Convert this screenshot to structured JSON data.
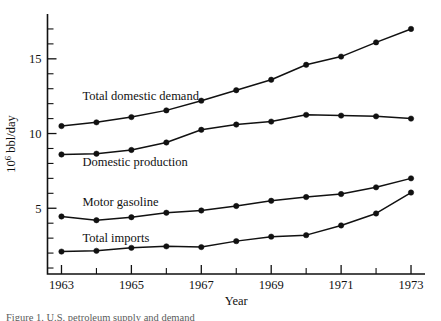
{
  "figure": {
    "caption_fragment": "Figure 1. U.S. petroleum supply and demand"
  },
  "chart_data": {
    "type": "line",
    "title": "",
    "xlabel": "Year",
    "ylabel": "10⁶ bbl/day",
    "x": [
      1963,
      1964,
      1965,
      1966,
      1967,
      1968,
      1969,
      1970,
      1971,
      1972,
      1973
    ],
    "xlim": [
      1962.6,
      1973.4
    ],
    "ylim": [
      0.6,
      18.0
    ],
    "xticks": [
      1963,
      1964,
      1965,
      1966,
      1967,
      1968,
      1969,
      1970,
      1971,
      1972,
      1973
    ],
    "xtick_labels": [
      "1963",
      "",
      "1965",
      "",
      "1967",
      "",
      "1969",
      "",
      "1971",
      "",
      "1973"
    ],
    "yticks": [
      1,
      2,
      3,
      4,
      5,
      6,
      7,
      8,
      9,
      10,
      11,
      12,
      13,
      14,
      15,
      16,
      17
    ],
    "ytick_labels": [
      "",
      "",
      "",
      "",
      "5",
      "",
      "",
      "",
      "",
      "10",
      "",
      "",
      "",
      "",
      "15",
      "",
      ""
    ],
    "grid": false,
    "legend": "inline-labels",
    "series": [
      {
        "name": "Total domestic demand",
        "label": "Total domestic demand",
        "label_x": 1963.6,
        "label_y": 12.55,
        "values": [
          10.5,
          10.75,
          11.1,
          11.55,
          12.2,
          12.9,
          13.6,
          14.6,
          15.15,
          16.1,
          17.0
        ]
      },
      {
        "name": "Domestic production",
        "label": "Domestic production",
        "label_x": 1963.6,
        "label_y": 8.1,
        "values": [
          8.6,
          8.65,
          8.9,
          9.4,
          10.25,
          10.6,
          10.8,
          11.25,
          11.2,
          11.15,
          11.0
        ]
      },
      {
        "name": "Motor gasoline",
        "label": "Motor gasoline",
        "label_x": 1963.6,
        "label_y": 5.45,
        "values": [
          4.45,
          4.2,
          4.4,
          4.7,
          4.85,
          5.15,
          5.5,
          5.75,
          5.95,
          6.4,
          7.0
        ]
      },
      {
        "name": "Total imports",
        "label": "Total imports",
        "label_x": 1963.6,
        "label_y": 3.05,
        "values": [
          2.1,
          2.15,
          2.35,
          2.45,
          2.4,
          2.8,
          3.1,
          3.2,
          3.85,
          4.65,
          6.05
        ]
      }
    ]
  }
}
